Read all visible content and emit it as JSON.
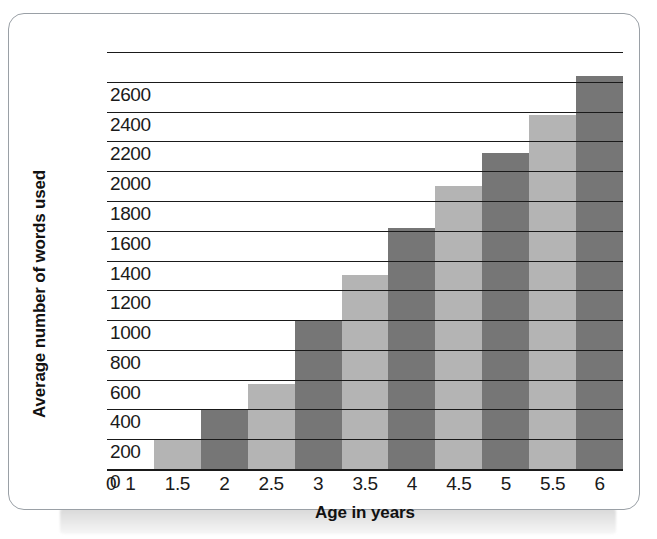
{
  "figure": {
    "card_background": "#ffffff",
    "card_border_color": "#9aa0a6"
  },
  "chart_data": {
    "type": "bar",
    "title": "",
    "xlabel": "Age in years",
    "ylabel": "Average number of words used",
    "categories": [
      "1.5",
      "2",
      "2.5",
      "3",
      "3.5",
      "4",
      "4.5",
      "5",
      "5.5",
      "6"
    ],
    "values": [
      200,
      400,
      570,
      1000,
      1300,
      1620,
      1900,
      2120,
      2380,
      2640
    ],
    "x_tick_labels": [
      "0",
      "1",
      "1.5",
      "2",
      "2.5",
      "3",
      "3.5",
      "4",
      "4.5",
      "5",
      "5.5",
      "6"
    ],
    "y_tick_labels": [
      "2600",
      "2400",
      "2200",
      "2000",
      "1800",
      "1600",
      "1400",
      "1200",
      "1000",
      "800",
      "600",
      "400",
      "200",
      "0"
    ],
    "y_tick_values": [
      2600,
      2400,
      2200,
      2000,
      1800,
      1600,
      1400,
      1200,
      1000,
      800,
      600,
      400,
      200,
      0
    ],
    "ylim": [
      0,
      2800
    ],
    "xlim": [
      0.75,
      6.25
    ],
    "grid": "horizontal",
    "legend": "none",
    "bar_colors": [
      "#b4b4b4",
      "#767676"
    ],
    "bar_color_light": "#b4b4b4",
    "bar_color_dark": "#767676",
    "gridline_color": "#1a1a1a",
    "axis_color": "#1a1a1a",
    "series": [
      {
        "name": "Average number of words used",
        "points": [
          {
            "x": "1.5",
            "y": 200,
            "color": "#b4b4b4"
          },
          {
            "x": "2",
            "y": 400,
            "color": "#767676"
          },
          {
            "x": "2.5",
            "y": 570,
            "color": "#b4b4b4"
          },
          {
            "x": "3",
            "y": 1000,
            "color": "#767676"
          },
          {
            "x": "3.5",
            "y": 1300,
            "color": "#b4b4b4"
          },
          {
            "x": "4",
            "y": 1620,
            "color": "#767676"
          },
          {
            "x": "4.5",
            "y": 1900,
            "color": "#b4b4b4"
          },
          {
            "x": "5",
            "y": 2120,
            "color": "#767676"
          },
          {
            "x": "5.5",
            "y": 2380,
            "color": "#b4b4b4"
          },
          {
            "x": "6",
            "y": 2640,
            "color": "#767676"
          }
        ]
      }
    ]
  }
}
